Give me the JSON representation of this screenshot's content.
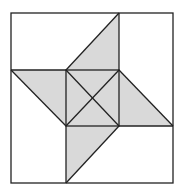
{
  "diagram": {
    "title": "",
    "colors": {
      "background": "#ffffff",
      "fill": "#d9d9d9",
      "stroke": "#222222"
    },
    "outer_square": {
      "x1": 11,
      "y1": 13,
      "x2": 173,
      "y2": 183
    },
    "inner_square": {
      "x1": 66,
      "y1": 70,
      "x2": 119,
      "y2": 126
    },
    "shaded_shapes": [
      {
        "name": "top-triangle",
        "points": "66,70 119,13 119,70"
      },
      {
        "name": "left-triangle",
        "points": "11,70 66,70 66,126"
      },
      {
        "name": "right-triangle",
        "points": "119,70 173,126 119,126"
      },
      {
        "name": "bottom-triangle",
        "points": "66,126 119,126 66,183"
      },
      {
        "name": "center-square",
        "points": "66,70 119,70 119,126 66,126"
      }
    ]
  }
}
